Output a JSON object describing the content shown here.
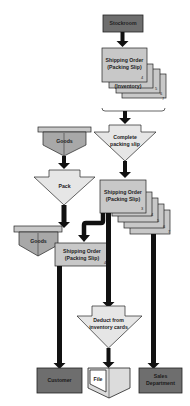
{
  "diagram": {
    "type": "flowchart",
    "colors": {
      "dark_box": "#6e6e6e",
      "doc_fill": "#c8c8c8",
      "process_fill": "#e6e6e6",
      "stroke": "#222222",
      "arrow": "#111111"
    },
    "nodes": {
      "stockroom": {
        "label": "Stockroom"
      },
      "shipping_order_top": {
        "label_line1": "Shipping Order",
        "label_line2": "(Packing Slip)",
        "inventory_label": "(Inventory)",
        "copies": [
          "4",
          "5",
          "6",
          "7"
        ]
      },
      "complete_packing_slip": {
        "label_line1": "Complete",
        "label_line2": "packing slip"
      },
      "goods_top": {
        "label": "Goods"
      },
      "pack": {
        "label": "Pack"
      },
      "shipping_order_mid": {
        "label_line1": "Shipping Order",
        "label_line2": "(Packing Slip)",
        "copies": [
          "3",
          "4",
          "5",
          "6",
          "7"
        ]
      },
      "goods_bottom": {
        "label": "Goods"
      },
      "shipping_order_left": {
        "label_line1": "Shipping Order",
        "label_line2": "(Packing Slip)",
        "copy": "4"
      },
      "deduct": {
        "label_line1": "Deduct from",
        "label_line2": "inventory cards"
      },
      "customer": {
        "label": "Customer"
      },
      "file": {
        "label": "File"
      },
      "sales_department": {
        "label_line1": "Sales",
        "label_line2": "Department"
      }
    }
  }
}
